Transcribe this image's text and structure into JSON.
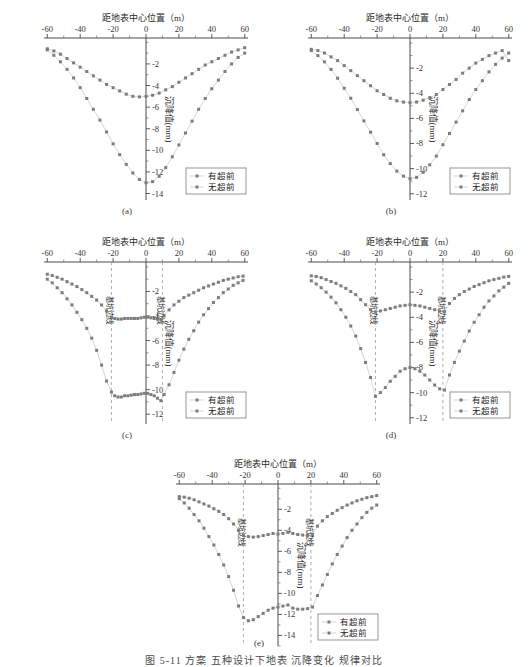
{
  "figure": {
    "caption": "图 5-11  方案 五种设计下地表 沉降变化 规律对比",
    "panel_labels": [
      "(a)",
      "(b)",
      "(c)",
      "(d)",
      "(e)"
    ]
  },
  "common": {
    "xlabel": "距地表中心位置（m）",
    "ylabel": "沉降值(mm)",
    "xticks": [
      -60,
      -40,
      -20,
      0,
      20,
      40,
      60
    ],
    "xticklabels": [
      "-60",
      "-40",
      "-20",
      "0",
      "20",
      "40",
      "60"
    ],
    "legend": [
      {
        "label": "有超前",
        "color": "#7a7a7a"
      },
      {
        "label": "无超前",
        "color": "#8c8c8c"
      }
    ],
    "pit_edge_label": "基坑边线",
    "marker_color": "#7c7c7c",
    "line_color": "#bcbcbc"
  },
  "chart_data": [
    {
      "id": "a",
      "type": "scatter",
      "panel_label": "(a)",
      "title": "",
      "xlabel": "距地表中心位置（m）",
      "ylabel": "沉降值(mm)",
      "xlim": [
        -62,
        62
      ],
      "ylim": [
        -14.6,
        0.4
      ],
      "yticks": [
        -2,
        -4,
        -6,
        -8,
        -10,
        -12,
        -14
      ],
      "yticklabels": [
        "-2",
        "-4",
        "-6",
        "-8",
        "-10",
        "-12",
        "-14"
      ],
      "grid": false,
      "legend_position": "lower-right",
      "pit_edges": [],
      "series": [
        {
          "name": "有超前",
          "x": [
            -60,
            -56,
            -52,
            -48,
            -44,
            -40,
            -36,
            -32,
            -28,
            -24,
            -20,
            -16,
            -12,
            -8,
            -4,
            0,
            4,
            8,
            12,
            16,
            20,
            24,
            28,
            32,
            36,
            40,
            44,
            48,
            52,
            56,
            60
          ],
          "y": [
            -0.6,
            -0.8,
            -1.1,
            -1.5,
            -1.9,
            -2.3,
            -2.7,
            -3.1,
            -3.5,
            -3.9,
            -4.2,
            -4.5,
            -4.8,
            -5.0,
            -5.05,
            -5.0,
            -4.9,
            -4.7,
            -4.4,
            -4.1,
            -3.7,
            -3.3,
            -2.9,
            -2.5,
            -2.1,
            -1.8,
            -1.5,
            -1.2,
            -0.9,
            -0.7,
            -0.5
          ]
        },
        {
          "name": "无超前",
          "x": [
            -60,
            -56,
            -52,
            -48,
            -44,
            -40,
            -36,
            -32,
            -28,
            -24,
            -20,
            -16,
            -12,
            -8,
            -4,
            0,
            4,
            8,
            12,
            16,
            20,
            24,
            28,
            32,
            36,
            40,
            44,
            48,
            52,
            56,
            60
          ],
          "y": [
            -0.7,
            -1.2,
            -1.8,
            -2.5,
            -3.3,
            -4.2,
            -5.2,
            -6.2,
            -7.2,
            -8.3,
            -9.4,
            -10.4,
            -11.3,
            -12.1,
            -12.7,
            -13.0,
            -12.9,
            -12.4,
            -11.6,
            -10.6,
            -9.5,
            -8.4,
            -7.3,
            -6.2,
            -5.2,
            -4.3,
            -3.5,
            -2.7,
            -2.0,
            -1.4,
            -1.0
          ]
        }
      ]
    },
    {
      "id": "b",
      "type": "scatter",
      "panel_label": "(b)",
      "title": "",
      "xlabel": "距地表中心位置（m）",
      "ylabel": "沉降值(mm)",
      "xlim": [
        -62,
        62
      ],
      "ylim": [
        -12.5,
        0.4
      ],
      "yticks": [
        -2,
        -4,
        -6,
        -8,
        -10,
        -12
      ],
      "yticklabels": [
        "-2",
        "-4",
        "-6",
        "-8",
        "-10",
        "-12"
      ],
      "grid": false,
      "legend_position": "lower-right",
      "pit_edges": [],
      "series": [
        {
          "name": "有超前",
          "x": [
            -60,
            -56,
            -52,
            -48,
            -44,
            -40,
            -36,
            -32,
            -28,
            -24,
            -20,
            -16,
            -12,
            -8,
            -4,
            0,
            4,
            8,
            12,
            16,
            20,
            24,
            28,
            32,
            36,
            40,
            44,
            48,
            52,
            56,
            60
          ],
          "y": [
            -0.5,
            -0.6,
            -0.8,
            -1.1,
            -1.4,
            -1.8,
            -2.2,
            -2.6,
            -3.0,
            -3.4,
            -3.8,
            -4.1,
            -4.4,
            -4.6,
            -4.7,
            -4.75,
            -4.7,
            -4.55,
            -4.35,
            -4.1,
            -3.7,
            -3.3,
            -2.9,
            -2.4,
            -2.0,
            -1.6,
            -1.3,
            -1.0,
            -0.8,
            -0.6,
            -1.4
          ]
        },
        {
          "name": "无超前",
          "x": [
            -60,
            -56,
            -52,
            -48,
            -44,
            -40,
            -36,
            -32,
            -28,
            -24,
            -20,
            -16,
            -12,
            -8,
            -4,
            0,
            4,
            8,
            12,
            16,
            20,
            24,
            28,
            32,
            36,
            40,
            44,
            48,
            52,
            56,
            60
          ],
          "y": [
            -0.6,
            -1.0,
            -1.5,
            -2.1,
            -2.8,
            -3.6,
            -4.4,
            -5.3,
            -6.2,
            -7.1,
            -8.0,
            -8.9,
            -9.6,
            -10.2,
            -10.6,
            -10.8,
            -10.7,
            -10.3,
            -9.7,
            -9.0,
            -8.1,
            -7.2,
            -6.3,
            -5.4,
            -4.5,
            -3.7,
            -3.0,
            -2.3,
            -1.7,
            -1.2,
            -0.8
          ]
        }
      ]
    },
    {
      "id": "c",
      "type": "scatter",
      "panel_label": "(c)",
      "title": "",
      "xlabel": "距地表中心位置（m）",
      "ylabel": "沉降值(mm)",
      "xlim": [
        -62,
        62
      ],
      "ylim": [
        -12.8,
        0.4
      ],
      "yticks": [
        -2,
        -4,
        -6,
        -8,
        -10,
        -12
      ],
      "yticklabels": [
        "-2",
        "-4",
        "-6",
        "-8",
        "-10",
        "-12"
      ],
      "grid": false,
      "legend_position": "lower-right",
      "pit_edges": [
        -21,
        10
      ],
      "series": [
        {
          "name": "有超前",
          "x": [
            -60,
            -57,
            -54,
            -51,
            -48,
            -45,
            -42,
            -39,
            -36,
            -33,
            -30,
            -27,
            -24,
            -21,
            -19,
            -17,
            -15,
            -13,
            -11,
            -9,
            -7,
            -5,
            -3,
            -1,
            1,
            3,
            5,
            7,
            9,
            11,
            14,
            17,
            20,
            23,
            26,
            29,
            32,
            35,
            38,
            41,
            44,
            47,
            50,
            53,
            56,
            59
          ],
          "y": [
            -0.6,
            -0.7,
            -0.85,
            -1.0,
            -1.2,
            -1.4,
            -1.6,
            -1.85,
            -2.1,
            -2.4,
            -2.7,
            -3.1,
            -3.6,
            -4.1,
            -4.2,
            -4.25,
            -4.25,
            -4.2,
            -4.2,
            -4.2,
            -4.2,
            -4.2,
            -4.15,
            -4.1,
            -4.1,
            -4.15,
            -4.2,
            -4.25,
            -4.3,
            -4.0,
            -3.5,
            -3.1,
            -2.8,
            -2.5,
            -2.3,
            -2.1,
            -1.9,
            -1.7,
            -1.55,
            -1.4,
            -1.25,
            -1.1,
            -1.0,
            -0.9,
            -0.8,
            -0.75
          ]
        },
        {
          "name": "无超前",
          "x": [
            -60,
            -57,
            -54,
            -51,
            -48,
            -45,
            -42,
            -39,
            -36,
            -33,
            -30,
            -27,
            -24,
            -21,
            -19,
            -17,
            -15,
            -13,
            -11,
            -9,
            -7,
            -5,
            -3,
            -1,
            1,
            3,
            5,
            7,
            9,
            11,
            14,
            17,
            20,
            23,
            26,
            29,
            32,
            35,
            38,
            41,
            44,
            47,
            50,
            53,
            56,
            59
          ],
          "y": [
            -1.0,
            -1.3,
            -1.7,
            -2.1,
            -2.6,
            -3.1,
            -3.7,
            -4.3,
            -5.0,
            -5.8,
            -6.8,
            -8.0,
            -9.3,
            -10.2,
            -10.5,
            -10.6,
            -10.6,
            -10.5,
            -10.5,
            -10.45,
            -10.4,
            -10.4,
            -10.35,
            -10.3,
            -10.3,
            -10.4,
            -10.5,
            -10.7,
            -10.9,
            -10.4,
            -9.6,
            -8.6,
            -7.6,
            -6.7,
            -5.9,
            -5.2,
            -4.5,
            -3.9,
            -3.4,
            -2.9,
            -2.5,
            -2.1,
            -1.8,
            -1.5,
            -1.3,
            -1.1
          ]
        }
      ]
    },
    {
      "id": "d",
      "type": "scatter",
      "panel_label": "(d)",
      "title": "",
      "xlabel": "距地表中心位置（m）",
      "ylabel": "沉降值(mm)",
      "xlim": [
        -62,
        62
      ],
      "ylim": [
        -12.5,
        0.4
      ],
      "yticks": [
        -2,
        -4,
        -6,
        -8,
        -10,
        -12
      ],
      "yticklabels": [
        "-2",
        "-4",
        "-6",
        "-8",
        "-10",
        "-12"
      ],
      "grid": false,
      "legend_position": "lower-right",
      "pit_edges": [
        -21,
        20
      ],
      "series": [
        {
          "name": "有超前",
          "x": [
            -60,
            -57,
            -54,
            -51,
            -48,
            -45,
            -42,
            -39,
            -36,
            -33,
            -30,
            -27,
            -24,
            -21,
            -18,
            -15,
            -12,
            -9,
            -6,
            -3,
            0,
            3,
            6,
            9,
            12,
            15,
            18,
            21,
            24,
            27,
            30,
            33,
            36,
            39,
            42,
            45,
            48,
            51,
            54,
            57,
            60
          ],
          "y": [
            -0.7,
            -0.75,
            -0.85,
            -1.0,
            -1.15,
            -1.3,
            -1.5,
            -1.7,
            -1.95,
            -2.2,
            -2.6,
            -3.0,
            -3.4,
            -3.6,
            -3.5,
            -3.4,
            -3.3,
            -3.2,
            -3.1,
            -3.05,
            -3.0,
            -3.05,
            -3.1,
            -3.2,
            -3.3,
            -3.4,
            -3.5,
            -3.55,
            -2.9,
            -2.5,
            -2.2,
            -1.95,
            -1.75,
            -1.55,
            -1.4,
            -1.25,
            -1.1,
            -1.0,
            -0.9,
            -0.8,
            -0.75
          ]
        },
        {
          "name": "无超前",
          "x": [
            -60,
            -57,
            -54,
            -51,
            -48,
            -45,
            -42,
            -39,
            -36,
            -33,
            -30,
            -27,
            -24,
            -21,
            -18,
            -15,
            -12,
            -9,
            -6,
            -3,
            0,
            3,
            6,
            9,
            12,
            15,
            18,
            21,
            24,
            27,
            30,
            33,
            36,
            39,
            42,
            45,
            48,
            51,
            54,
            57,
            60
          ],
          "y": [
            -1.1,
            -1.35,
            -1.65,
            -2.0,
            -2.4,
            -2.85,
            -3.4,
            -4.0,
            -4.7,
            -5.5,
            -6.5,
            -7.6,
            -8.8,
            -10.3,
            -10.0,
            -9.6,
            -9.1,
            -8.7,
            -8.3,
            -8.1,
            -8.0,
            -8.1,
            -8.3,
            -8.6,
            -9.0,
            -9.4,
            -9.7,
            -9.8,
            -8.6,
            -7.6,
            -6.7,
            -5.9,
            -5.1,
            -4.4,
            -3.8,
            -3.2,
            -2.7,
            -2.3,
            -1.9,
            -1.6,
            -1.3
          ]
        }
      ]
    },
    {
      "id": "e",
      "type": "scatter",
      "panel_label": "(e)",
      "title": "",
      "xlabel": "距地表中心位置（m）",
      "ylabel": "沉降值(mm)",
      "xlim": [
        -62,
        62
      ],
      "ylim": [
        -15.0,
        0.4
      ],
      "yticks": [
        -2,
        -4,
        -6,
        -8,
        -10,
        -12,
        -14
      ],
      "yticklabels": [
        "-2",
        "-4",
        "-6",
        "-8",
        "-10",
        "-12",
        "-14"
      ],
      "grid": false,
      "legend_position": "lower-right",
      "pit_edges": [
        -21,
        20
      ],
      "series": [
        {
          "name": "有超前",
          "x": [
            -60,
            -57,
            -54,
            -51,
            -48,
            -45,
            -42,
            -39,
            -36,
            -33,
            -30,
            -27,
            -24,
            -21,
            -18,
            -15,
            -12,
            -9,
            -6,
            -3,
            0,
            3,
            6,
            9,
            12,
            15,
            18,
            21,
            24,
            27,
            30,
            33,
            36,
            39,
            42,
            45,
            48,
            51,
            54,
            57,
            60
          ],
          "y": [
            -0.8,
            -0.85,
            -0.95,
            -1.1,
            -1.3,
            -1.5,
            -1.7,
            -1.95,
            -2.2,
            -2.5,
            -2.9,
            -3.4,
            -4.0,
            -4.5,
            -4.6,
            -4.65,
            -4.6,
            -4.5,
            -4.4,
            -4.3,
            -4.35,
            -4.3,
            -4.2,
            -4.3,
            -4.4,
            -4.45,
            -4.5,
            -4.4,
            -3.6,
            -3.1,
            -2.7,
            -2.4,
            -2.1,
            -1.85,
            -1.6,
            -1.4,
            -1.2,
            -1.05,
            -0.9,
            -0.8,
            -0.7
          ]
        },
        {
          "name": "无超前",
          "x": [
            -60,
            -57,
            -54,
            -51,
            -48,
            -45,
            -42,
            -39,
            -36,
            -33,
            -30,
            -27,
            -24,
            -21,
            -18,
            -15,
            -12,
            -9,
            -6,
            -3,
            0,
            3,
            6,
            9,
            12,
            15,
            18,
            21,
            24,
            27,
            30,
            33,
            36,
            39,
            42,
            45,
            48,
            51,
            54,
            57,
            60
          ],
          "y": [
            -1.0,
            -1.4,
            -1.9,
            -2.5,
            -3.1,
            -3.8,
            -4.6,
            -5.4,
            -6.3,
            -7.3,
            -8.4,
            -9.7,
            -11.2,
            -12.3,
            -12.6,
            -12.5,
            -12.2,
            -11.9,
            -11.6,
            -11.4,
            -11.3,
            -11.2,
            -11.1,
            -11.4,
            -11.5,
            -11.5,
            -11.45,
            -11.3,
            -10.2,
            -9.2,
            -8.2,
            -7.2,
            -6.3,
            -5.5,
            -4.7,
            -4.0,
            -3.4,
            -2.8,
            -2.3,
            -1.9,
            -1.6
          ]
        }
      ]
    }
  ]
}
